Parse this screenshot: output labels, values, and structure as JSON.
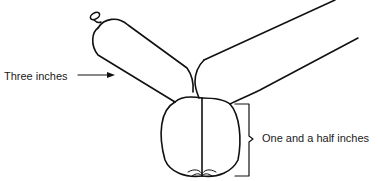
{
  "figure": {
    "labels": {
      "segment_length": "Three inches",
      "bubble_size": "One and a half inches"
    },
    "colors": {
      "stroke": "#111111",
      "background": "#ffffff",
      "text": "#1a1a1a"
    }
  }
}
